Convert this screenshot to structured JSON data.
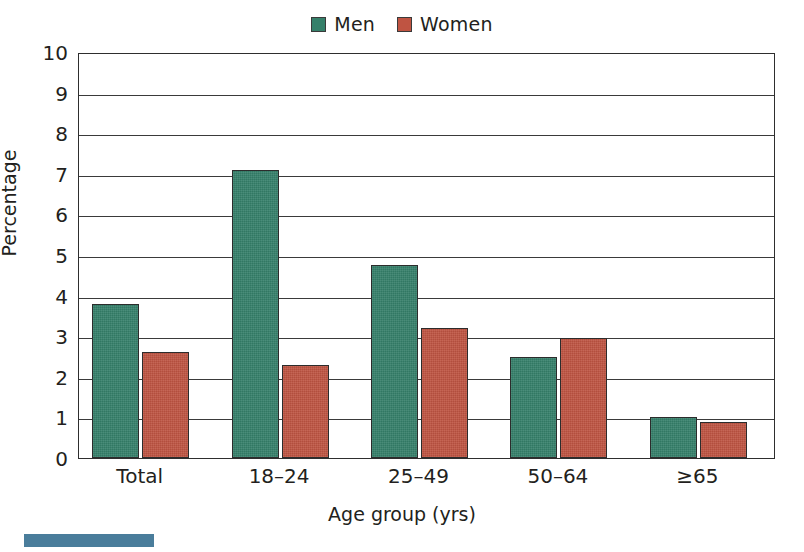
{
  "chart_data": {
    "type": "bar",
    "title": "",
    "xlabel": "Age group (yrs)",
    "ylabel": "Percentage",
    "categories": [
      "Total",
      "18–24",
      "25–49",
      "50–64",
      "≥65"
    ],
    "series": [
      {
        "name": "Men",
        "color": "#35806a",
        "values": [
          3.8,
          7.1,
          4.75,
          2.5,
          1.0
        ]
      },
      {
        "name": "Women",
        "color": "#bf5442",
        "values": [
          2.6,
          2.3,
          3.2,
          2.95,
          0.88
        ]
      }
    ],
    "ylim": [
      0,
      10
    ],
    "yticks": [
      0,
      1,
      2,
      3,
      4,
      5,
      6,
      7,
      8,
      9,
      10
    ],
    "ytick_labels": [
      "0",
      "1",
      "2",
      "3",
      "4",
      "5",
      "6",
      "7",
      "8",
      "9",
      "10"
    ],
    "grid": "horizontal",
    "legend_position": "top-center"
  },
  "legend": {
    "entries": [
      {
        "label": "Men",
        "color": "#35806a"
      },
      {
        "label": "Women",
        "color": "#bf5442"
      }
    ]
  },
  "axes": {
    "x_title": "Age group (yrs)",
    "y_title": "Percentage"
  },
  "artifact": {
    "caption_text": "",
    "color": "#4a7d9b"
  }
}
